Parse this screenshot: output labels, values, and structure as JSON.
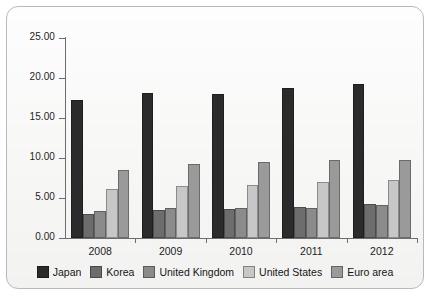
{
  "chart_data": {
    "type": "bar",
    "title": "",
    "subtitle": "",
    "xlabel": "",
    "ylabel": "",
    "categories": [
      "2008",
      "2009",
      "2010",
      "2011",
      "2012"
    ],
    "ylim": [
      0,
      25
    ],
    "ytick_labels": [
      "0.00",
      "5.00",
      "10.00",
      "15.00",
      "20.00",
      "25.00"
    ],
    "ytick_values": [
      0,
      5,
      10,
      15,
      20,
      25
    ],
    "grid": false,
    "legend_position": "bottom",
    "series": [
      {
        "name": "Japan",
        "color": "#2b2b2b",
        "values": [
          17.2,
          18.1,
          18.0,
          18.8,
          19.2
        ]
      },
      {
        "name": "Korea",
        "color": "#6d6d6d",
        "values": [
          3.0,
          3.5,
          3.6,
          3.9,
          4.3
        ]
      },
      {
        "name": "United Kingdom",
        "color": "#8b8b8b",
        "values": [
          3.4,
          3.8,
          3.7,
          3.7,
          4.1
        ]
      },
      {
        "name": "United States",
        "color": "#c7c7c7",
        "values": [
          6.1,
          6.5,
          6.6,
          7.0,
          7.2
        ]
      },
      {
        "name": "Euro area",
        "color": "#9a9a9a",
        "values": [
          8.5,
          9.3,
          9.5,
          9.8,
          9.8
        ]
      }
    ]
  }
}
